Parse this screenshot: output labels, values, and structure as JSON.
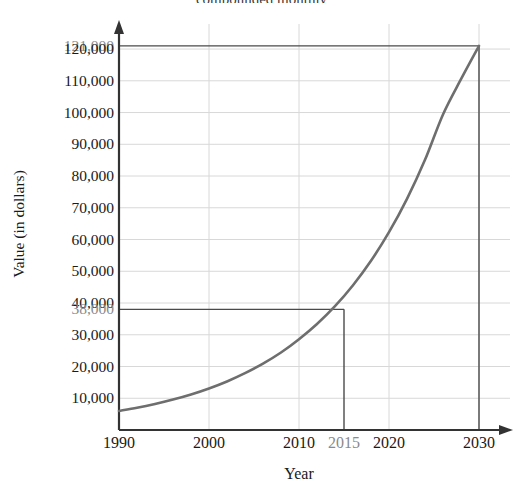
{
  "chart_data": {
    "type": "line",
    "title": "compounded monthly",
    "title_note": "title is cropped at the top edge of the screenshot; only the trailing words are legible",
    "xlabel": "Year",
    "ylabel": "Value (in dollars)",
    "xlim": [
      1990,
      2032
    ],
    "ylim": [
      0,
      126000
    ],
    "grid": true,
    "legend": "none",
    "x_ticks": [
      {
        "value": 1990,
        "label": "1990",
        "emphasis": "normal"
      },
      {
        "value": 2000,
        "label": "2000",
        "emphasis": "normal"
      },
      {
        "value": 2010,
        "label": "2010",
        "emphasis": "normal"
      },
      {
        "value": 2015,
        "label": "2015",
        "emphasis": "annotation"
      },
      {
        "value": 2020,
        "label": "2020",
        "emphasis": "normal"
      },
      {
        "value": 2030,
        "label": "2030",
        "emphasis": "normal"
      }
    ],
    "y_ticks": [
      {
        "value": 121000,
        "label": "121,000",
        "emphasis": "annotation"
      },
      {
        "value": 120000,
        "label": "120,000",
        "emphasis": "normal"
      },
      {
        "value": 110000,
        "label": "110,000",
        "emphasis": "normal"
      },
      {
        "value": 100000,
        "label": "100,000",
        "emphasis": "normal"
      },
      {
        "value": 90000,
        "label": "90,000",
        "emphasis": "normal"
      },
      {
        "value": 80000,
        "label": "80,000",
        "emphasis": "normal"
      },
      {
        "value": 70000,
        "label": "70,000",
        "emphasis": "normal"
      },
      {
        "value": 60000,
        "label": "60,000",
        "emphasis": "normal"
      },
      {
        "value": 50000,
        "label": "50,000",
        "emphasis": "normal"
      },
      {
        "value": 40000,
        "label": "40,000",
        "emphasis": "normal"
      },
      {
        "value": 38000,
        "label": "38,000",
        "emphasis": "annotation"
      },
      {
        "value": 30000,
        "label": "30,000",
        "emphasis": "normal"
      },
      {
        "value": 20000,
        "label": "20,000",
        "emphasis": "normal"
      },
      {
        "value": 10000,
        "label": "10,000",
        "emphasis": "normal"
      }
    ],
    "gridlines_y": [
      120000,
      110000,
      100000,
      90000,
      80000,
      70000,
      60000,
      50000,
      40000,
      30000,
      20000,
      10000
    ],
    "gridlines_x": [
      2000,
      2010,
      2020,
      2030
    ],
    "series": [
      {
        "name": "Account value",
        "color": "#6e6e6e",
        "x": [
          1990,
          1992,
          1994,
          1996,
          1998,
          2000,
          2002,
          2004,
          2006,
          2008,
          2010,
          2012,
          2014,
          2015,
          2016,
          2018,
          2020,
          2022,
          2024,
          2026,
          2028,
          2030
        ],
        "values": [
          6000,
          7000,
          8200,
          9600,
          11200,
          13100,
          15300,
          17900,
          20900,
          24400,
          28600,
          33400,
          39000,
          38000,
          45600,
          53300,
          62300,
          72800,
          85100,
          99400,
          110500,
          121000
        ]
      }
    ],
    "annotations": [
      {
        "name": "marker-2015",
        "x": 2015,
        "y": 38000,
        "x_label": "2015",
        "y_label": "38,000",
        "style": "horizontal guide from y-axis to curve, vertical guide from curve down to x-axis"
      },
      {
        "name": "marker-2030",
        "x": 2030,
        "y": 121000,
        "x_label": "2030",
        "y_label": "121,000",
        "style": "horizontal guide from y-axis to curve, vertical guide from curve down to x-axis"
      }
    ],
    "colors": {
      "curve": "#6e6e6e",
      "axis": "#333333",
      "gridline": "#d8d8d8",
      "annotation_line": "#4a4a4a",
      "tick_text": "#1a1a1a",
      "annotation_text": "#8a8a8a",
      "background": "#ffffff"
    }
  }
}
